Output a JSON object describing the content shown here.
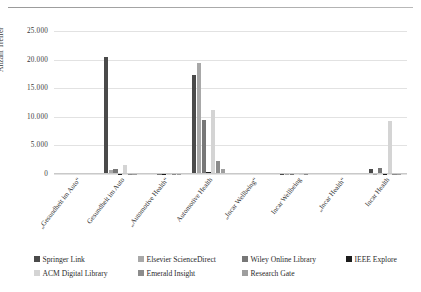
{
  "chart_data": {
    "type": "bar",
    "title": "",
    "xlabel": "",
    "ylabel": "Anzahl Treffer",
    "ylim": [
      0,
      25000
    ],
    "yticks": [
      "0",
      "5.000",
      "10.000",
      "15.000",
      "20.000",
      "25.000"
    ],
    "ytick_values": [
      0,
      5000,
      10000,
      15000,
      20000,
      25000
    ],
    "grid": true,
    "legend_position": "bottom",
    "categories": [
      "„Gesundheit im Auto“",
      "Gesundheit im Auto",
      "„Automotive Health“",
      "Automotive Health",
      "„Incar Wellbeing“",
      "Incar Wellbeing",
      "„Incar Health“",
      "Incar Health"
    ],
    "series": [
      {
        "name": "Springer Link",
        "color": "#4a4a4a",
        "values": [
          0,
          20500,
          250,
          17300,
          0,
          60,
          0,
          900
        ]
      },
      {
        "name": "Elsevier ScienceDirect",
        "color": "#a8a8a8",
        "values": [
          0,
          700,
          120,
          19400,
          0,
          40,
          0,
          80
        ]
      },
      {
        "name": "Wiley Online Library",
        "color": "#777777",
        "values": [
          0,
          950,
          90,
          9400,
          0,
          30,
          0,
          1050
        ]
      },
      {
        "name": "IEEE Explore",
        "color": "#1c1c1c",
        "values": [
          0,
          60,
          30,
          400,
          0,
          10,
          0,
          40
        ]
      },
      {
        "name": "ACM Digital Library",
        "color": "#d4d4d4",
        "values": [
          0,
          1650,
          60,
          11200,
          0,
          20,
          0,
          9200
        ]
      },
      {
        "name": "Emerald Insight",
        "color": "#8c8c8c",
        "values": [
          0,
          90,
          40,
          2350,
          0,
          15,
          0,
          60
        ]
      },
      {
        "name": "Research Gate",
        "color": "#9e9e9e",
        "values": [
          0,
          40,
          20,
          900,
          0,
          10,
          0,
          30
        ]
      }
    ]
  },
  "legend": {
    "items": [
      {
        "label": "Springer Link",
        "color": "#4a4a4a"
      },
      {
        "label": "Elsevier ScienceDirect",
        "color": "#a8a8a8"
      },
      {
        "label": "Wiley Online Library",
        "color": "#777777"
      },
      {
        "label": "IEEE Explore",
        "color": "#1c1c1c"
      },
      {
        "label": "ACM Digital Library",
        "color": "#d4d4d4"
      },
      {
        "label": "Emerald Insight",
        "color": "#8c8c8c"
      },
      {
        "label": "Research Gate",
        "color": "#9e9e9e"
      }
    ]
  }
}
